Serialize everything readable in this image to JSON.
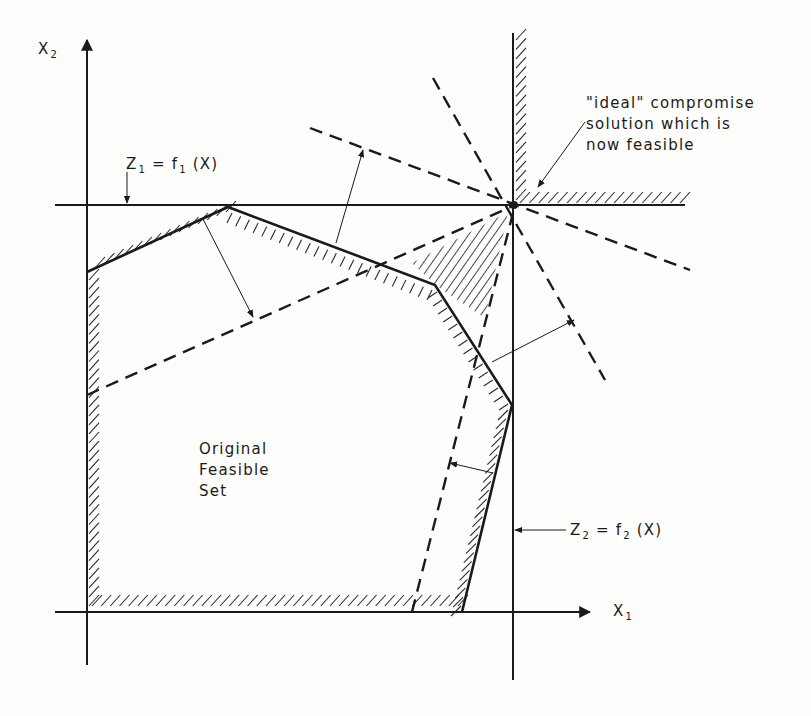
{
  "diagram": {
    "axes": {
      "x": {
        "label": "X",
        "subscript": "1"
      },
      "y": {
        "label": "X",
        "subscript": "2"
      }
    },
    "objectives": [
      {
        "id": "z1",
        "lhs": "Z",
        "lhs_sub": "1",
        "eq": " = ",
        "rhs": "f",
        "rhs_sub": "1",
        "arg": " (X)",
        "orientation": "horizontal"
      },
      {
        "id": "z2",
        "lhs": "Z",
        "lhs_sub": "2",
        "eq": " = ",
        "rhs": "f",
        "rhs_sub": "2",
        "arg": " (X)",
        "orientation": "vertical"
      }
    ],
    "regions": {
      "original": {
        "lines": [
          "Original",
          "Feasible",
          "Set"
        ]
      },
      "expanded_wedge": {
        "description": "newly feasible region (hatched wedge)"
      }
    },
    "annotation": {
      "lines": [
        "\"ideal\" compromise",
        "solution which is",
        "now feasible"
      ]
    },
    "constraint_shifts": [
      {
        "from": "upper-left edge",
        "to": "dashed line 1",
        "direction": "outward"
      },
      {
        "from": "upper-right edge",
        "to": "dashed line 2",
        "direction": "outward"
      },
      {
        "from": "right edge",
        "to": "dashed line 3",
        "direction": "outward"
      },
      {
        "from": "lower-right edge",
        "to": "dashed line 4",
        "direction": "outward"
      }
    ],
    "colors": {
      "ink": "#1a1a1a",
      "paper": "#fdfdfb"
    }
  }
}
